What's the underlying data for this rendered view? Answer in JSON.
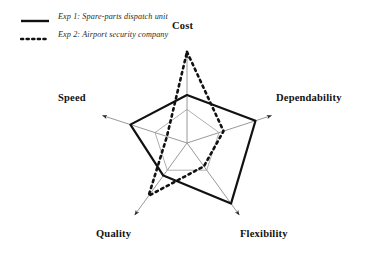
{
  "figure": {
    "background": "#ffffff",
    "width": 367,
    "height": 259
  },
  "legend": {
    "position": "top-left",
    "items": [
      {
        "key": "exp1",
        "label": "Exp 1: Spare-parts dispatch unit",
        "style": "solid",
        "color": "#111111",
        "swatch_name": "solid-line-swatch"
      },
      {
        "key": "exp2",
        "label": "Exp 2: Airport security company",
        "style": "dotted",
        "color": "#111111",
        "swatch_name": "dotted-line-swatch"
      }
    ]
  },
  "axis_labels": {
    "cost": "Cost",
    "dependability": "Dependability",
    "speed": "Speed",
    "quality": "Quality",
    "flexibility": "Flexibility"
  },
  "chart_data": {
    "type": "radar",
    "title": "",
    "subtitle": "",
    "xlabel": "",
    "ylabel": "",
    "grid": true,
    "legend_position": "top-left",
    "axis_order": [
      "Cost",
      "Dependability",
      "Flexibility",
      "Quality",
      "Speed"
    ],
    "categories": [
      "Cost",
      "Dependability",
      "Flexibility",
      "Quality",
      "Speed"
    ],
    "scale": {
      "min": 0,
      "max": 100,
      "units": "relative performance (%)"
    },
    "grid_rings": [
      35
    ],
    "center": {
      "x": 187,
      "y": 143
    },
    "axis_length_px": 96,
    "series": [
      {
        "name": "Exp 1: Spare-parts dispatch unit",
        "key": "exp1",
        "style": "solid",
        "color": "#111111",
        "line_width": 2.2,
        "values": [
          50,
          75,
          78,
          42,
          62
        ]
      },
      {
        "name": "Exp 2: Airport security company",
        "key": "exp2",
        "style": "dotted",
        "color": "#111111",
        "line_width": 2.6,
        "values": [
          95,
          40,
          30,
          68,
          22
        ]
      }
    ],
    "annotations": [
      {
        "text": "Cost",
        "axis": "Cost",
        "placement": "outer-top"
      },
      {
        "text": "Dependability",
        "axis": "Dependability",
        "placement": "outer-right"
      },
      {
        "text": "Flexibility",
        "axis": "Flexibility",
        "placement": "outer-bottom-right"
      },
      {
        "text": "Quality",
        "axis": "Quality",
        "placement": "outer-bottom-left"
      },
      {
        "text": "Speed",
        "axis": "Speed",
        "placement": "outer-left"
      }
    ]
  }
}
